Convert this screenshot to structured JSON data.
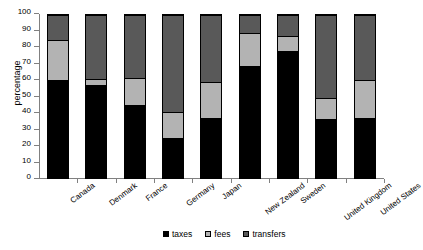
{
  "chart_data": {
    "type": "bar",
    "subtype": "stacked-bar-100",
    "title": "",
    "xlabel": "",
    "ylabel": "percentage",
    "ylim": [
      0,
      100
    ],
    "yticks": [
      0,
      10,
      20,
      30,
      40,
      50,
      60,
      70,
      80,
      90,
      100
    ],
    "ytick_labels": [
      "0",
      "10",
      "20",
      "30",
      "40",
      "50",
      "60",
      "70",
      "80",
      "90",
      "100"
    ],
    "grid": false,
    "legend_position": "bottom",
    "categories": [
      "Canada",
      "Denmark",
      "France",
      "Germany",
      "Japan",
      "New Zealand",
      "Sweden",
      "United Kingdom",
      "United States"
    ],
    "series": [
      {
        "name": "taxes",
        "color": "#000000",
        "values": [
          60,
          57,
          44.5,
          24.5,
          37,
          68.5,
          78,
          36,
          37
        ]
      },
      {
        "name": "fees",
        "color": "#b3b3b3",
        "values": [
          24.5,
          4,
          17,
          16,
          22,
          20.5,
          9,
          13,
          23
        ]
      },
      {
        "name": "transfers",
        "color": "#595959",
        "values": [
          15.5,
          39,
          38.5,
          59.5,
          41,
          11,
          13,
          51,
          40
        ]
      }
    ]
  },
  "legend": {
    "items": [
      {
        "label": "taxes",
        "color": "#000000"
      },
      {
        "label": "fees",
        "color": "#b3b3b3"
      },
      {
        "label": "transfers",
        "color": "#595959"
      }
    ]
  },
  "axis": {
    "y_title": "percentage"
  }
}
